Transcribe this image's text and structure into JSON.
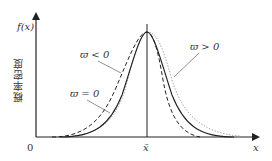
{
  "figure": {
    "y_axis_label": "f(x)",
    "y_axis_title": "概率密度",
    "x_axis_label": "x",
    "origin_label": "0",
    "mean_label": "x̄",
    "curves": [
      {
        "name": "skew-negative",
        "label": "ϖ < 0",
        "style": "dashed",
        "color": "#222222"
      },
      {
        "name": "skew-zero",
        "label": "ϖ = 0",
        "style": "solid",
        "color": "#222222"
      },
      {
        "name": "skew-positive",
        "label": "ϖ > 0",
        "style": "dotted",
        "color": "#aaaaaa"
      }
    ]
  }
}
